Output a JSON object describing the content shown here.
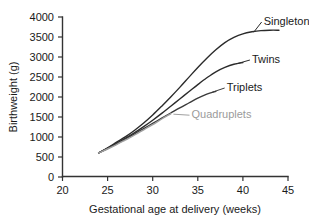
{
  "chart_data": {
    "type": "line",
    "title": "",
    "xlabel": "Gestational age at delivery (weeks)",
    "ylabel": "Birthweight (g)",
    "xlim": [
      20,
      45
    ],
    "ylim": [
      0,
      4000
    ],
    "xticks": [
      20,
      25,
      30,
      35,
      40,
      45
    ],
    "yticks": [
      0,
      500,
      1000,
      1500,
      2000,
      2500,
      3000,
      3500,
      4000
    ],
    "xtick_labels": [
      "20",
      "25",
      "30",
      "35",
      "40",
      "45"
    ],
    "ytick_labels": [
      "0",
      "500",
      "1000",
      "1500",
      "2000",
      "2500",
      "3000",
      "3500",
      "4000"
    ],
    "grid": false,
    "legend": "inline-labels",
    "series": [
      {
        "name": "Singletons",
        "color": "#2b2b2b",
        "label": "Singletons",
        "x": [
          24,
          25,
          26,
          27,
          28,
          29,
          30,
          31,
          32,
          33,
          34,
          35,
          36,
          37,
          38,
          39,
          40,
          41,
          42,
          43,
          44
        ],
        "values": [
          600,
          730,
          870,
          1010,
          1170,
          1350,
          1550,
          1770,
          2000,
          2240,
          2490,
          2740,
          2970,
          3180,
          3360,
          3490,
          3580,
          3630,
          3660,
          3670,
          3670
        ]
      },
      {
        "name": "Twins",
        "color": "#2b2b2b",
        "label": "Twins",
        "x": [
          24,
          25,
          26,
          27,
          28,
          29,
          30,
          31,
          32,
          33,
          34,
          35,
          36,
          37,
          38,
          39,
          40
        ],
        "values": [
          600,
          720,
          840,
          970,
          1110,
          1260,
          1420,
          1590,
          1770,
          1950,
          2130,
          2310,
          2480,
          2630,
          2740,
          2820,
          2860
        ]
      },
      {
        "name": "Triplets",
        "color": "#3a3a3a",
        "label": "Triplets",
        "x": [
          24,
          25,
          26,
          27,
          28,
          29,
          30,
          31,
          32,
          33,
          34,
          35,
          36,
          37
        ],
        "values": [
          600,
          710,
          830,
          950,
          1080,
          1210,
          1340,
          1470,
          1600,
          1730,
          1850,
          1970,
          2070,
          2140
        ]
      },
      {
        "name": "Quadruplets",
        "color": "#a0a0a0",
        "label": "Quadruplets",
        "x": [
          24,
          25,
          26,
          27,
          28,
          29,
          30,
          31,
          32
        ],
        "values": [
          600,
          700,
          810,
          930,
          1050,
          1180,
          1310,
          1450,
          1580
        ]
      }
    ],
    "annotations": [
      {
        "text": "Singletons",
        "x": 42.3,
        "y": 3900,
        "leader_to": [
          41.2,
          3620
        ]
      },
      {
        "text": "Twins",
        "x": 41.0,
        "y": 2950,
        "leader_to": [
          39.3,
          2830
        ]
      },
      {
        "text": "Triplets",
        "x": 38.2,
        "y": 2250,
        "leader_to": [
          36.6,
          2120
        ]
      },
      {
        "text": "Quadruplets",
        "x": 34.3,
        "y": 1570,
        "leader_to": [
          32.3,
          1570
        ]
      }
    ]
  }
}
